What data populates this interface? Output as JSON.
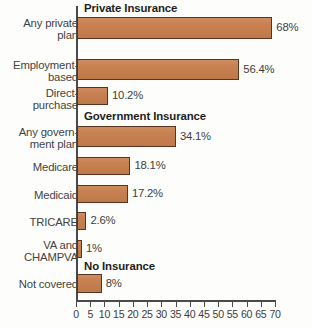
{
  "chart_data": {
    "type": "bar",
    "orientation": "horizontal",
    "title": "",
    "xlabel": "",
    "ylabel": "",
    "xlim": [
      0,
      70
    ],
    "xticks": [
      0,
      5,
      10,
      15,
      20,
      25,
      30,
      35,
      40,
      45,
      50,
      55,
      60,
      65,
      70
    ],
    "xtick_labels": [
      "0",
      "5",
      "10",
      "15",
      "20",
      "25",
      "30",
      "35",
      "40",
      "45",
      "50",
      "55",
      "60",
      "65",
      "70"
    ],
    "grid": false,
    "legend": false,
    "value_suffix": "%",
    "bar_color": "#c8804f",
    "bar_border_color": "#5a3420",
    "categories": [
      "Any private plan",
      "Employment-based",
      "Direct-purchase",
      "Any government plan",
      "Medicare",
      "Medicaid",
      "TRICARE",
      "VA and CHAMPVA",
      "Not covered"
    ],
    "values": [
      68,
      56.4,
      10.2,
      34.1,
      18.1,
      17.2,
      2.6,
      1,
      8
    ],
    "value_labels": [
      "68%",
      "56.4%",
      "10.2%",
      "34.1%",
      "18.1%",
      "17.2%",
      "2.6%",
      "1%",
      "8%"
    ],
    "section_headers": [
      "Private Insurance",
      "Government Insurance",
      "No Insurance"
    ],
    "groups": [
      {
        "header": "Private Insurance",
        "items": [
          {
            "label": "Any private\nplan",
            "value": 68,
            "value_label": "68%"
          },
          {
            "label": "Employment-\nbased",
            "value": 56.4,
            "value_label": "56.4%"
          },
          {
            "label": "Direct-\npurchase",
            "value": 10.2,
            "value_label": "10.2%"
          }
        ]
      },
      {
        "header": "Government Insurance",
        "items": [
          {
            "label": "Any govern-\nment plan",
            "value": 34.1,
            "value_label": "34.1%"
          },
          {
            "label": "Medicare",
            "value": 18.1,
            "value_label": "18.1%"
          },
          {
            "label": "Medicaid",
            "value": 17.2,
            "value_label": "17.2%"
          },
          {
            "label": "TRICARE",
            "value": 2.6,
            "value_label": "2.6%"
          },
          {
            "label": "VA and\nCHAMPVA",
            "value": 1,
            "value_label": "1%"
          }
        ]
      },
      {
        "header": "No Insurance",
        "items": [
          {
            "label": "Not covered",
            "value": 8,
            "value_label": "8%"
          }
        ]
      }
    ]
  },
  "layout": {
    "headers": [
      {
        "text": "Private Insurance",
        "top": 2,
        "left": 8
      },
      {
        "text": "Government Insurance",
        "top": 110,
        "left": 8
      },
      {
        "text": "No Insurance",
        "top": 260,
        "left": 8
      }
    ],
    "rows": [
      {
        "label": "Any private\nplan",
        "label_top": 18,
        "bar_top": 17,
        "bar_h": 22,
        "value": 68,
        "value_label": "68%"
      },
      {
        "label": "Employment-\nbased",
        "label_top": 60,
        "bar_top": 59,
        "bar_h": 21,
        "value": 56.4,
        "value_label": "56.4%"
      },
      {
        "label": "Direct-\npurchase",
        "label_top": 88,
        "bar_top": 87,
        "bar_h": 18,
        "value": 10.2,
        "value_label": "10.2%"
      },
      {
        "label": "Any govern-\nment plan",
        "label_top": 127,
        "bar_top": 126,
        "bar_h": 21,
        "value": 34.1,
        "value_label": "34.1%"
      },
      {
        "label": "Medicare",
        "label_top": 162,
        "bar_top": 157,
        "bar_h": 18,
        "value": 18.1,
        "value_label": "18.1%"
      },
      {
        "label": "Medicaid",
        "label_top": 190,
        "bar_top": 185,
        "bar_h": 18,
        "value": 17.2,
        "value_label": "17.2%"
      },
      {
        "label": "TRICARE",
        "label_top": 217,
        "bar_top": 212,
        "bar_h": 18,
        "value": 2.6,
        "value_label": "2.6%"
      },
      {
        "label": "VA and\nCHAMPVA",
        "label_top": 240,
        "bar_top": 240,
        "bar_h": 18,
        "value": 1,
        "value_label": "1%"
      },
      {
        "label": "Not covered",
        "label_top": 279,
        "bar_top": 274,
        "bar_h": 19,
        "value": 8,
        "value_label": "8%"
      }
    ]
  }
}
